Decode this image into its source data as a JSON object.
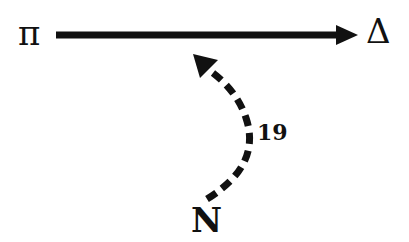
{
  "diagram": {
    "nodes": [
      {
        "id": "pi",
        "label": "π"
      },
      {
        "id": "delta",
        "label": "Δ"
      },
      {
        "id": "n",
        "label": "N"
      }
    ],
    "edges": [
      {
        "from": "pi",
        "to": "delta",
        "style": "solid",
        "label": ""
      },
      {
        "from": "n",
        "to": "pi-delta-edge",
        "style": "dashed",
        "label": "19"
      }
    ],
    "colors": {
      "ink": "#111111",
      "background": "#ffffff"
    }
  }
}
